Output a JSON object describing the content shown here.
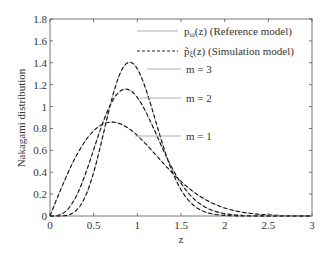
{
  "chart_data": {
    "type": "line",
    "title": "",
    "xlabel": "z",
    "ylabel": "Nakagami distribution",
    "xlim": [
      0,
      3
    ],
    "ylim": [
      0,
      1.8
    ],
    "grid": false,
    "xticks": [
      "0",
      "0.5",
      "1",
      "1.5",
      "2",
      "2.5",
      "3"
    ],
    "yticks": [
      "0",
      "0.2",
      "0.4",
      "0.6",
      "0.8",
      "1",
      "1.2",
      "1.4",
      "1.6",
      "1.8"
    ],
    "legend": {
      "position": "upper right",
      "entries": [
        {
          "label": "pω(z) (Reference model)",
          "style": "solid"
        },
        {
          "label": "p̃ξ(z) (Simulation model)",
          "style": "dashed"
        }
      ]
    },
    "annotations": [
      {
        "text": "m = 3",
        "x": 0.92,
        "y": 1.4
      },
      {
        "text": "m = 2",
        "x": 0.92,
        "y": 1.14
      },
      {
        "text": "m = 1",
        "x": 1.0,
        "y": 0.74
      }
    ],
    "omega": 1.0,
    "x": [
      0,
      0.25,
      0.5,
      0.75,
      1.0,
      1.25,
      1.5,
      1.75,
      2.0,
      2.5,
      3.0
    ],
    "series": [
      {
        "name": "m = 1",
        "m": 1,
        "values": [
          0,
          0.47,
          0.779,
          0.855,
          0.736,
          0.524,
          0.316,
          0.163,
          0.073,
          0.01,
          0.001
        ]
      },
      {
        "name": "m = 2",
        "m": 2,
        "values": [
          0,
          0.109,
          0.607,
          1.075,
          1.083,
          0.683,
          0.303,
          0.1,
          0.022,
          0.0,
          0.0
        ]
      },
      {
        "name": "m = 3",
        "m": 3,
        "values": [
          0,
          0.019,
          0.33,
          1.127,
          1.344,
          0.598,
          0.149,
          0.023,
          0.002,
          0.0,
          0.0
        ]
      }
    ]
  },
  "legend": {
    "ref_main": "p",
    "ref_sub": "ω",
    "ref_rest": "(z) (Reference model)",
    "sim_main": "p̃",
    "sim_sub": "ξ",
    "sim_rest": "(z) (Simulation model)"
  },
  "labels": {
    "m3": "m = 3",
    "m2": "m = 2",
    "m1": "m = 1",
    "xlabel": "z",
    "ylabel": "Nakagami distribution"
  }
}
